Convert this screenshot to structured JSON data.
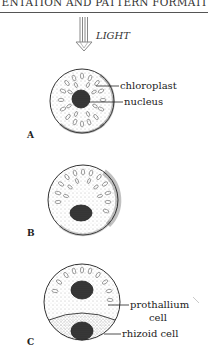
{
  "header": {
    "running_title": "ENTATION AND PATTERN FORMATI"
  },
  "figure": {
    "light_label": "LIGHT",
    "panels": [
      {
        "id": "A",
        "label": "A",
        "annotations": [
          "chloroplast",
          "nucleus"
        ]
      },
      {
        "id": "B",
        "label": "B",
        "annotations": []
      },
      {
        "id": "C",
        "label": "C",
        "annotations": [
          "prothallium",
          "cell",
          "rhizoid cell"
        ]
      }
    ]
  },
  "colors": {
    "ink": "#222222",
    "background": "#ffffff",
    "nucleus": "#3a3a3a"
  }
}
